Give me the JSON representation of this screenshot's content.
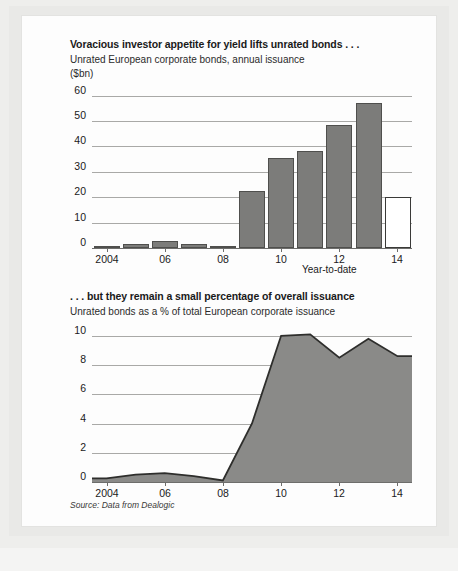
{
  "figure": {
    "source_note": "Source: Data from Dealogic"
  },
  "charts": [
    {
      "id": "unrated-issuance",
      "title": "Voracious investor appetite for yield lifts unrated bonds . . .",
      "subtitle": "Unrated European corporate bonds, annual issuance",
      "unit": "($bn)",
      "footnote": "Year-to-date",
      "y_ticks": [
        "60",
        "50",
        "40",
        "30",
        "20",
        "10",
        "0"
      ],
      "x_ticks": [
        "2004",
        "06",
        "08",
        "10",
        "12",
        "14"
      ],
      "colors": {
        "bar_fill": "#7c7c7a",
        "bar_stroke": "#4f4f4d",
        "open_bar_fill": "#ffffff",
        "grid": "#a9a9a7"
      }
    },
    {
      "id": "unrated-share",
      "title": ". . . but they remain a small percentage of overall issuance",
      "subtitle": "Unrated bonds as a % of total European corporate issuance",
      "unit": "",
      "footnote": "",
      "y_ticks": [
        "10",
        "8",
        "6",
        "4",
        "2",
        "0"
      ],
      "x_ticks": [
        "2004",
        "06",
        "08",
        "10",
        "12",
        "14"
      ],
      "colors": {
        "area_fill": "#8a8a88",
        "area_stroke": "#2e2e2c",
        "grid": "#a9a9a7"
      }
    }
  ],
  "chart_data": [
    {
      "type": "bar",
      "title": "Voracious investor appetite for yield lifts unrated bonds . . .",
      "subtitle": "Unrated European corporate bonds, annual issuance",
      "xlabel": "",
      "ylabel": "($bn)",
      "ylim": [
        0,
        63
      ],
      "yticks": [
        0,
        10,
        20,
        30,
        40,
        50,
        60
      ],
      "grid": true,
      "legend": "none",
      "categories": [
        "2004",
        "2005",
        "2006",
        "2007",
        "2008",
        "2009",
        "2010",
        "2011",
        "2012",
        "2013",
        "2014"
      ],
      "tick_categories": [
        "2004",
        "06",
        "08",
        "10",
        "12",
        "14"
      ],
      "values": [
        0.8,
        1.4,
        2.6,
        1.5,
        0.6,
        22.5,
        35.5,
        38.0,
        48.5,
        57.0,
        20.0
      ],
      "highlight": {
        "category": "2014",
        "style": "open/white bar",
        "note": "Year-to-date"
      }
    },
    {
      "type": "area",
      "title": ". . . but they remain a small percentage of overall issuance",
      "subtitle": "Unrated bonds as a % of total European corporate issuance",
      "xlabel": "",
      "ylabel": "%",
      "ylim": [
        0,
        10.6
      ],
      "yticks": [
        0,
        2,
        4,
        6,
        8,
        10
      ],
      "grid": true,
      "legend": "none",
      "x": [
        "2004",
        "2005",
        "2006",
        "2007",
        "2008",
        "2009",
        "2010",
        "2011",
        "2012",
        "2013",
        "2014"
      ],
      "tick_x": [
        "2004",
        "06",
        "08",
        "10",
        "12",
        "14"
      ],
      "values": [
        0.25,
        0.5,
        0.6,
        0.4,
        0.1,
        4.0,
        10.0,
        10.1,
        8.5,
        9.8,
        8.6
      ]
    }
  ]
}
